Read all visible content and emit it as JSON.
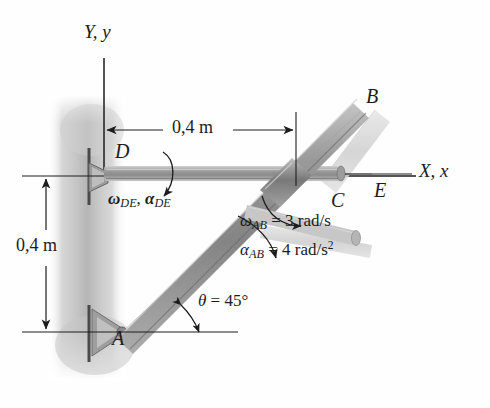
{
  "figure": {
    "background_color": "#ffffff",
    "ink_color": "#1c1c1c",
    "wall_shadow_color": "#b9b9b9",
    "rod_ab_color": "#8f8f8f",
    "rod_de_color": "#a6a6a6",
    "ghost_color": "#d8d8d8"
  },
  "axes": {
    "y_label": "Y, y",
    "x_label": "X, x"
  },
  "points": {
    "a": "A",
    "b": "B",
    "c": "C",
    "d": "D",
    "e": "E"
  },
  "dimensions": {
    "horizontal": "0,4 m",
    "vertical": "0,4 m"
  },
  "kinematics": {
    "de_label_omega": "ω",
    "de_label_omega_sub": "DE",
    "de_label_alpha": "α",
    "de_label_alpha_sub": "DE",
    "de_combined": "ωDE, αDE",
    "ab_omega_symbol": "ω",
    "ab_omega_sub": "AB",
    "ab_omega_value": "= 3 rad/s",
    "ab_alpha_symbol": "α",
    "ab_alpha_sub": "AB",
    "ab_alpha_value": "= 4 rad/s",
    "ab_alpha_exponent": "2",
    "theta_symbol": "θ",
    "theta_value": "= 45°"
  }
}
